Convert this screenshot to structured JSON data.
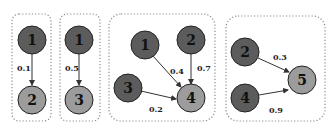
{
  "diagram": {
    "panels": [
      {
        "id": "panel-1",
        "nodes": [
          {
            "label": "1",
            "shade": "dark"
          },
          {
            "label": "2",
            "shade": "light"
          }
        ],
        "edges": [
          {
            "from": "1",
            "to": "2",
            "weight": "0.1"
          }
        ]
      },
      {
        "id": "panel-2",
        "nodes": [
          {
            "label": "1",
            "shade": "dark"
          },
          {
            "label": "3",
            "shade": "light"
          }
        ],
        "edges": [
          {
            "from": "1",
            "to": "3",
            "weight": "0.5"
          }
        ]
      },
      {
        "id": "panel-3",
        "nodes": [
          {
            "label": "1",
            "shade": "dark"
          },
          {
            "label": "2",
            "shade": "dark"
          },
          {
            "label": "3",
            "shade": "dark"
          },
          {
            "label": "4",
            "shade": "light"
          }
        ],
        "edges": [
          {
            "from": "1",
            "to": "4",
            "weight": "0.4"
          },
          {
            "from": "2",
            "to": "4",
            "weight": "0.7"
          },
          {
            "from": "3",
            "to": "4",
            "weight": "0.2"
          }
        ]
      },
      {
        "id": "panel-4",
        "nodes": [
          {
            "label": "2",
            "shade": "dark"
          },
          {
            "label": "4",
            "shade": "dark"
          },
          {
            "label": "5",
            "shade": "light"
          }
        ],
        "edges": [
          {
            "from": "2",
            "to": "5",
            "weight": "0.3"
          },
          {
            "from": "4",
            "to": "5",
            "weight": "0.9"
          }
        ]
      }
    ],
    "colors": {
      "parent_node": "#5c5c5c",
      "child_node": "#9c9c9c",
      "border": "#8a8a8a"
    }
  }
}
